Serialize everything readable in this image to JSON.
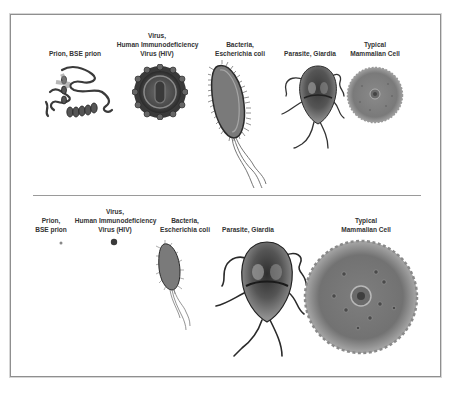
{
  "figure": {
    "top_row": {
      "title": "Approximate relative shapes (top panel)",
      "items": [
        {
          "id": "prion",
          "lines": [
            "Prion, BSE prion"
          ]
        },
        {
          "id": "virus",
          "lines": [
            "Virus,",
            "Human Immunodeficiency",
            "Virus (HIV)"
          ]
        },
        {
          "id": "bacteria",
          "lines": [
            "Bacteria,",
            "Escherichia coli"
          ]
        },
        {
          "id": "parasite",
          "lines": [
            "Parasite, Giardia"
          ]
        },
        {
          "id": "cell",
          "lines": [
            "Typical",
            "Mammalian Cell"
          ]
        }
      ]
    },
    "bottom_row": {
      "title": "Relative sizes to scale (bottom panel)",
      "items": [
        {
          "id": "prion",
          "lines": [
            "Prion,",
            "BSE prion"
          ]
        },
        {
          "id": "virus",
          "lines": [
            "Virus,",
            "Human Immunodeficiency",
            "Virus (HIV)"
          ]
        },
        {
          "id": "bacteria",
          "lines": [
            "Bacteria,",
            "Escherichia coli"
          ]
        },
        {
          "id": "parasite",
          "lines": [
            "Parasite, Giardia"
          ]
        },
        {
          "id": "cell",
          "lines": [
            "Typical",
            "Mammalian Cell"
          ]
        }
      ]
    },
    "colors": {
      "border": "#8f8f8f",
      "divider": "#9a9a9a",
      "ink": "#333333",
      "organism_dark": "#3a3a3a",
      "organism_mid": "#7a7a7a",
      "organism_light": "#b5b5b5"
    }
  }
}
